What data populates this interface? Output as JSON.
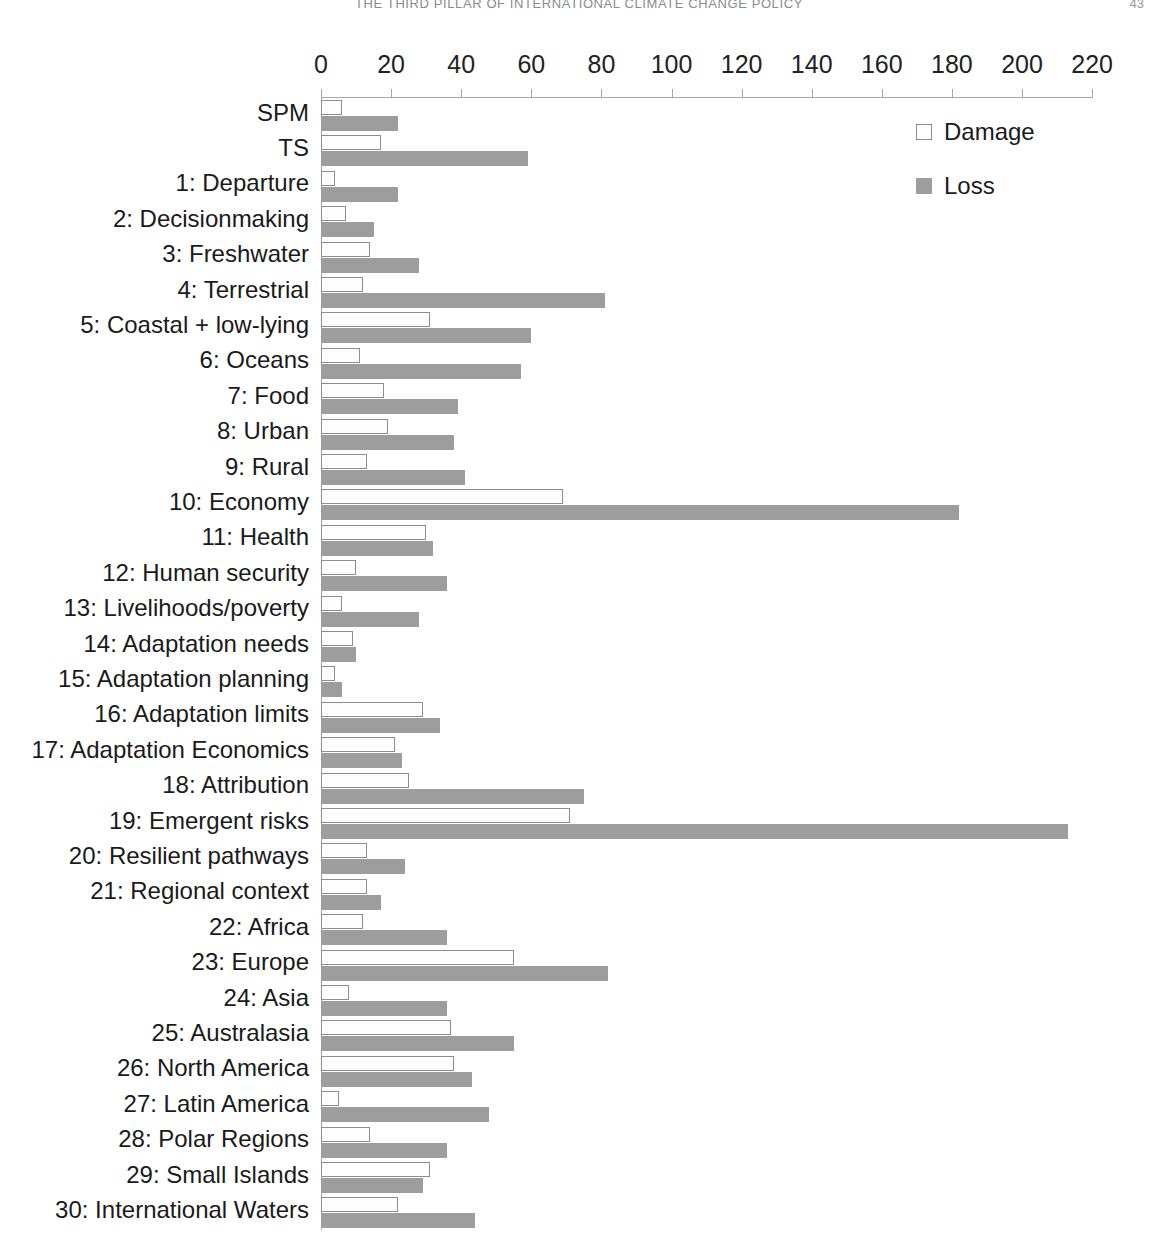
{
  "page": {
    "running_head": "THE THIRD PILLAR OF INTERNATIONAL CLIMATE CHANGE POLICY",
    "folio": "43"
  },
  "legend": {
    "position": "top-right",
    "items": [
      {
        "label": "Damage",
        "swatch": "open-square-swatch",
        "color": "#fdfdfd"
      },
      {
        "label": "Loss",
        "swatch": "filled-square-swatch",
        "color": "#9d9d9d"
      }
    ]
  },
  "chart_data": {
    "type": "bar",
    "orientation": "horizontal",
    "title": "",
    "subtitle": "",
    "xlabel": "",
    "ylabel": "",
    "xlim": [
      0,
      220
    ],
    "xticks": [
      0,
      20,
      40,
      60,
      80,
      100,
      120,
      140,
      160,
      180,
      200,
      220
    ],
    "grid": false,
    "legend_position": "top-right",
    "categories": [
      "SPM",
      "TS",
      "1: Departure",
      "2: Decisionmaking",
      "3: Freshwater",
      "4: Terrestrial",
      "5: Coastal + low-lying",
      "6: Oceans",
      "7: Food",
      "8: Urban",
      "9: Rural",
      "10: Economy",
      "11: Health",
      "12: Human security",
      "13: Livelihoods/poverty",
      "14: Adaptation needs",
      "15: Adaptation planning",
      "16: Adaptation limits",
      "17: Adaptation Economics",
      "18: Attribution",
      "19: Emergent risks",
      "20: Resilient pathways",
      "21: Regional context",
      "22: Africa",
      "23: Europe",
      "24: Asia",
      "25: Australasia",
      "26: North America",
      "27: Latin America",
      "28: Polar Regions",
      "29: Small Islands",
      "30:  International Waters"
    ],
    "series": [
      {
        "name": "Damage",
        "color": "#fdfdfd",
        "values": [
          6,
          17,
          4,
          7,
          14,
          12,
          31,
          11,
          18,
          19,
          13,
          69,
          30,
          10,
          6,
          9,
          4,
          29,
          21,
          25,
          71,
          13,
          13,
          12,
          55,
          8,
          37,
          38,
          5,
          14,
          31,
          22
        ]
      },
      {
        "name": "Loss",
        "color": "#9d9d9d",
        "values": [
          22,
          59,
          22,
          15,
          28,
          81,
          60,
          57,
          39,
          38,
          41,
          182,
          32,
          36,
          28,
          10,
          6,
          34,
          23,
          75,
          213,
          24,
          17,
          36,
          82,
          36,
          55,
          43,
          48,
          36,
          29,
          44
        ]
      }
    ]
  }
}
